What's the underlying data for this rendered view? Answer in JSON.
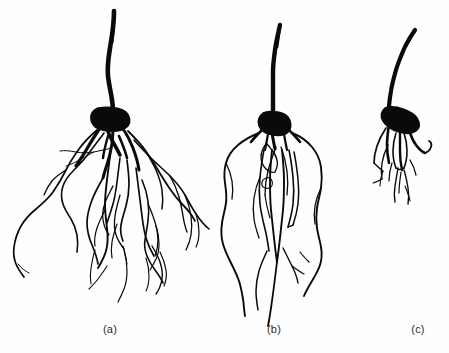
{
  "figure": {
    "kind": "scientific-line-drawing",
    "background_color": "#fefefe",
    "ink_color": "#000000",
    "width": 449,
    "height": 353,
    "panel_count": 3
  },
  "panels": [
    {
      "id": "a",
      "caption": "(a)",
      "description": "largest root system, wide spreading lateral roots with long shoot",
      "caption_x": 110,
      "caption_y": 330
    },
    {
      "id": "b",
      "caption": "(b)",
      "description": "medium root system, narrow elongated root mass with long shoot",
      "caption_x": 274,
      "caption_y": 330
    },
    {
      "id": "c",
      "caption": "(c)",
      "description": "smallest root system, short compact roots with curved shoot",
      "caption_x": 418,
      "caption_y": 330
    }
  ],
  "caption_style": {
    "font_size_px": 11,
    "color": "#2b2b2b"
  }
}
